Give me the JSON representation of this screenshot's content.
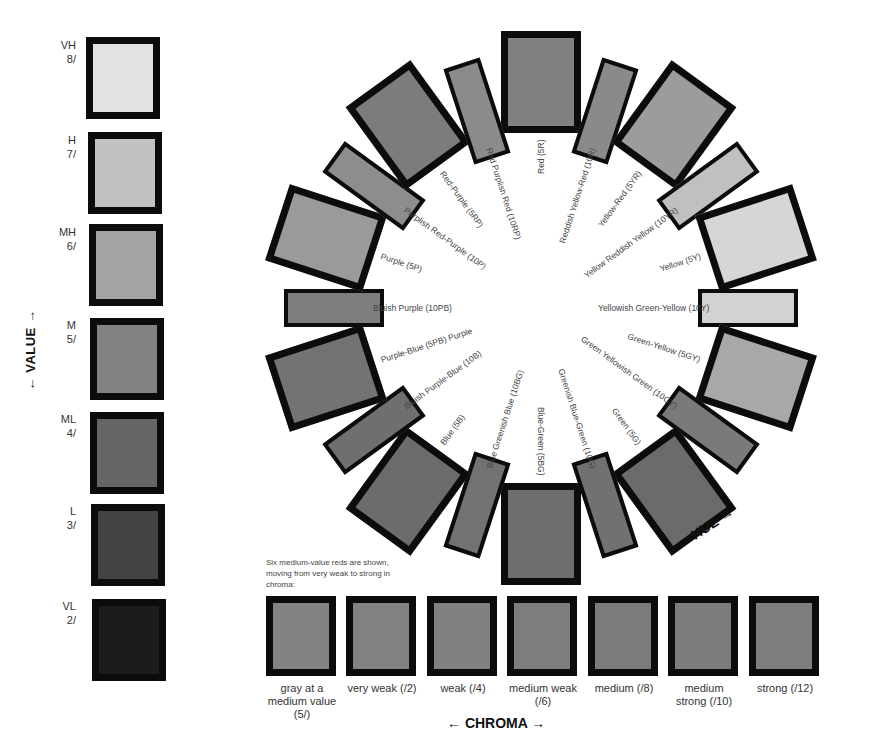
{
  "value_scale": {
    "axis_label": "VALUE",
    "axis_arrow_up": "↑",
    "axis_arrow_down": "↓",
    "levels": [
      {
        "code": "VH",
        "value": "8/",
        "color": "#e2e2e2"
      },
      {
        "code": "H",
        "value": "7/",
        "color": "#c2c2c2"
      },
      {
        "code": "MH",
        "value": "6/",
        "color": "#a3a3a3"
      },
      {
        "code": "M",
        "value": "5/",
        "color": "#828282"
      },
      {
        "code": "ML",
        "value": "4/",
        "color": "#666666"
      },
      {
        "code": "L",
        "value": "3/",
        "color": "#434343"
      },
      {
        "code": "VL",
        "value": "2/",
        "color": "#1c1c1c"
      }
    ]
  },
  "hue_wheel": {
    "axis_label": "HUE",
    "center": [
      541,
      308
    ],
    "hues": [
      {
        "label": "Red (5R)",
        "angle": 0,
        "kind": "big",
        "color": "#818181"
      },
      {
        "label": "Reddish Yellow-Red (10R)",
        "angle": 18,
        "kind": "narrow",
        "color": "#8a8a8a"
      },
      {
        "label": "Yellow-Red (5YR)",
        "angle": 36,
        "kind": "big",
        "color": "#9c9c9c"
      },
      {
        "label": "Yellow Reddish Yellow (10YR)",
        "angle": 54,
        "kind": "narrow",
        "color": "#c0c0c0"
      },
      {
        "label": "Yellow (5Y)",
        "angle": 72,
        "kind": "big",
        "color": "#d6d6d6"
      },
      {
        "label": "Yellowish Green-Yellow (10Y)",
        "angle": 90,
        "kind": "narrow",
        "color": "#d2d2d2"
      },
      {
        "label": "Green-Yellow (5GY)",
        "angle": 108,
        "kind": "big",
        "color": "#a8a8a8"
      },
      {
        "label": "Green Yellowish Green (10GY)",
        "angle": 126,
        "kind": "narrow",
        "color": "#7a7a7a"
      },
      {
        "label": "Green (5G)",
        "angle": 144,
        "kind": "big",
        "color": "#6b6b6b"
      },
      {
        "label": "Greenish Blue-Green (10G)",
        "angle": 162,
        "kind": "narrow",
        "color": "#717171"
      },
      {
        "label": "Blue-Green (5BG)",
        "angle": 180,
        "kind": "big",
        "color": "#6e6e6e"
      },
      {
        "label": "Blue Greenish Blue (10BG)",
        "angle": 198,
        "kind": "narrow",
        "color": "#727272"
      },
      {
        "label": "Blue (5B)",
        "angle": 216,
        "kind": "big",
        "color": "#6c6c6c"
      },
      {
        "label": "Bluish Purple-Blue (10B)",
        "angle": 234,
        "kind": "narrow",
        "color": "#6f6f6f"
      },
      {
        "label": "Purple-Blue (5PB) Purple",
        "angle": 252,
        "kind": "big",
        "color": "#737373"
      },
      {
        "label": "Bluish Purple (10PB)",
        "angle": 270,
        "kind": "narrow",
        "color": "#7e7e7e"
      },
      {
        "label": "Purple (5P)",
        "angle": 288,
        "kind": "big",
        "color": "#9a9a9a"
      },
      {
        "label": "Purplish Red-Purple (10P)",
        "angle": 306,
        "kind": "narrow",
        "color": "#8d8d8d"
      },
      {
        "label": "Red-Purple (5RP)",
        "angle": 324,
        "kind": "big",
        "color": "#7c7c7c"
      },
      {
        "label": "Red Purplish Red (10RP)",
        "angle": 342,
        "kind": "narrow",
        "color": "#8b8b8b"
      }
    ]
  },
  "chroma_scale": {
    "note": "Six medium-value reds are shown, moving from very weak to strong in chroma:",
    "axis_label": "CHROMA",
    "items": [
      {
        "caption": "gray at a medium value (5/)",
        "color": "#838383"
      },
      {
        "caption": "very weak (/2)",
        "color": "#828282"
      },
      {
        "caption": "weak (/4)",
        "color": "#808080"
      },
      {
        "caption": "medium weak (/6)",
        "color": "#7d7d7d"
      },
      {
        "caption": "medium (/8)",
        "color": "#7b7b7b"
      },
      {
        "caption": "medium strong (/10)",
        "color": "#7c7c7c"
      },
      {
        "caption": "strong (/12)",
        "color": "#7e7e7e"
      }
    ]
  }
}
